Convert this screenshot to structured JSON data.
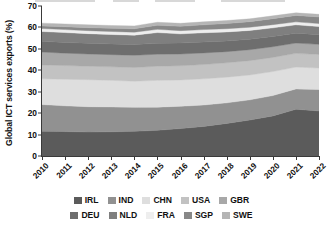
{
  "chart_data": {
    "type": "area",
    "title": "",
    "subtitle": "",
    "xlabel": "",
    "ylabel": "Global ICT services exports (%)",
    "stacked": true,
    "grid": false,
    "legend_position": "bottom",
    "x": [
      2010,
      2011,
      2012,
      2013,
      2014,
      2015,
      2016,
      2017,
      2018,
      2019,
      2020,
      2021,
      2022
    ],
    "xtick_labels": [
      "2010",
      "2011",
      "2012",
      "2013",
      "2014",
      "2015",
      "2016",
      "2017",
      "2018",
      "2019",
      "2020",
      "2021",
      "2022"
    ],
    "ytick_labels": [
      "0",
      "10",
      "20",
      "30",
      "40",
      "50",
      "60",
      "70"
    ],
    "yticks": [
      0,
      10,
      20,
      30,
      40,
      50,
      60,
      70
    ],
    "ylim": [
      0,
      70
    ],
    "xlim": [
      2010,
      2022
    ],
    "series": [
      {
        "name": "IRL",
        "color": "#5b5b5b",
        "values": [
          11.5,
          11.4,
          11.2,
          11.3,
          11.5,
          12.0,
          12.8,
          13.8,
          15.2,
          16.8,
          18.7,
          21.8,
          21.0
        ]
      },
      {
        "name": "IND",
        "color": "#919191",
        "values": [
          12.5,
          12.0,
          11.8,
          11.6,
          11.2,
          10.8,
          10.4,
          10.0,
          9.6,
          9.4,
          9.5,
          9.5,
          10.0
        ]
      },
      {
        "name": "CHN",
        "color": "#dedede",
        "values": [
          12.0,
          12.4,
          12.6,
          12.4,
          12.2,
          12.5,
          12.3,
          12.2,
          12.0,
          11.6,
          11.2,
          10.2,
          10.1
        ]
      },
      {
        "name": "USA",
        "color": "#c2c2c2",
        "values": [
          6.5,
          6.4,
          6.3,
          6.3,
          6.4,
          6.6,
          6.6,
          6.7,
          6.7,
          6.7,
          6.6,
          6.4,
          6.3
        ]
      },
      {
        "name": "GBR",
        "color": "#a8a8a8",
        "values": [
          6.0,
          5.8,
          5.7,
          5.7,
          5.7,
          5.6,
          5.5,
          5.4,
          5.2,
          5.1,
          5.0,
          4.8,
          4.7
        ]
      },
      {
        "name": "DEU",
        "color": "#6e6e6e",
        "values": [
          5.0,
          5.0,
          5.0,
          5.0,
          5.0,
          5.1,
          5.1,
          5.1,
          5.0,
          4.9,
          4.8,
          4.6,
          4.5
        ]
      },
      {
        "name": "NLD",
        "color": "#7f7f7f",
        "values": [
          4.6,
          4.6,
          4.5,
          4.4,
          4.4,
          5.0,
          4.3,
          4.3,
          4.2,
          4.1,
          4.0,
          3.9,
          3.8
        ]
      },
      {
        "name": "FRA",
        "color": "#eeeeee",
        "values": [
          1.4,
          1.4,
          1.4,
          1.4,
          1.4,
          1.5,
          1.5,
          1.5,
          1.5,
          1.5,
          1.5,
          1.4,
          1.4
        ]
      },
      {
        "name": "SGP",
        "color": "#888888",
        "values": [
          1.2,
          1.3,
          1.4,
          1.5,
          1.6,
          1.9,
          2.0,
          2.2,
          2.4,
          2.6,
          2.8,
          3.0,
          3.1
        ]
      },
      {
        "name": "SWE",
        "color": "#b5b5b5",
        "values": [
          1.3,
          1.3,
          1.3,
          1.3,
          1.3,
          1.4,
          1.4,
          1.4,
          1.4,
          1.3,
          1.3,
          1.2,
          1.2
        ]
      }
    ]
  },
  "axes": {
    "ylabel": "Global ICT services exports (%)"
  },
  "legend": {
    "rows": [
      [
        {
          "label": "IRL",
          "color": "#5b5b5b"
        },
        {
          "label": "IND",
          "color": "#919191"
        },
        {
          "label": "CHN",
          "color": "#dedede"
        },
        {
          "label": "USA",
          "color": "#c2c2c2"
        },
        {
          "label": "GBR",
          "color": "#a8a8a8"
        }
      ],
      [
        {
          "label": "DEU",
          "color": "#6e6e6e"
        },
        {
          "label": "NLD",
          "color": "#7f7f7f"
        },
        {
          "label": "FRA",
          "color": "#eeeeee"
        },
        {
          "label": "SGP",
          "color": "#888888"
        },
        {
          "label": "SWE",
          "color": "#b5b5b5"
        }
      ]
    ]
  }
}
